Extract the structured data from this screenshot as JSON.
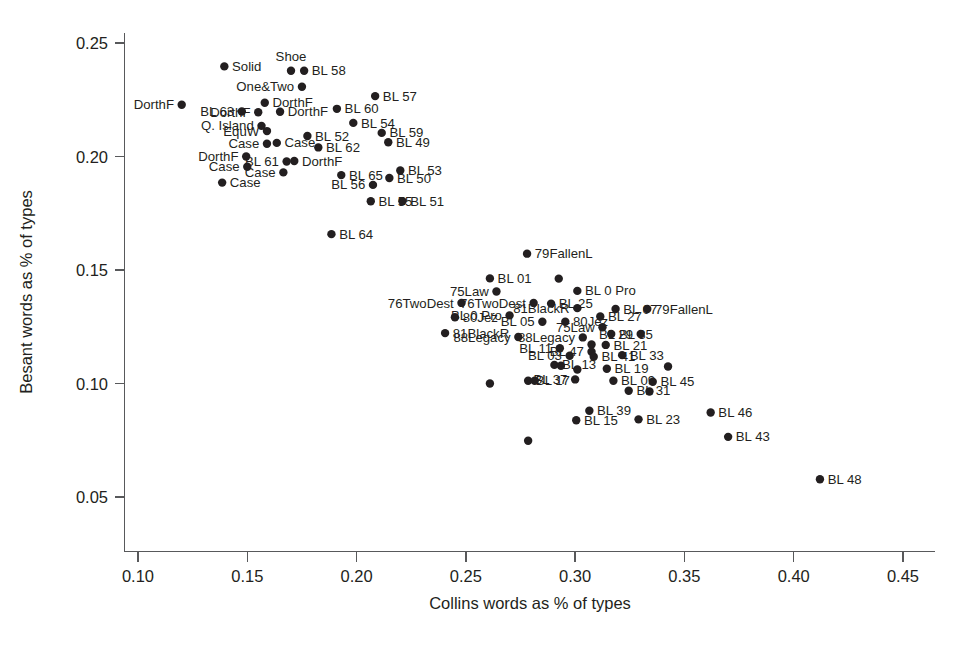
{
  "chart_data": {
    "type": "scatter",
    "title": "",
    "xlabel": "Collins words as % of types",
    "ylabel": "Besant words as % of types",
    "xlim": [
      0.0845,
      0.4655
    ],
    "ylim": [
      0.0445,
      0.2585
    ],
    "xticks": [
      0.1,
      0.15,
      0.2,
      0.25,
      0.3,
      0.35,
      0.4,
      0.45
    ],
    "xticklabels": [
      "0.10",
      "0.15",
      "0.20",
      "0.25",
      "0.30",
      "0.35",
      "0.40",
      "0.45"
    ],
    "yticks": [
      0.05,
      0.1,
      0.15,
      0.2,
      0.25
    ],
    "yticklabels": [
      "0.05",
      "0.10",
      "0.15",
      "0.20",
      "0.25"
    ],
    "grid": false,
    "legend": "none",
    "marker_color": "#231f20",
    "marker_size": 4.2,
    "points": [
      {
        "label": "Solid",
        "x": 0.1395,
        "y": 0.2397,
        "pos": "right"
      },
      {
        "label": "Shoe",
        "x": 0.17,
        "y": 0.2378,
        "pos": "above"
      },
      {
        "label": "BL 58",
        "x": 0.176,
        "y": 0.2378,
        "pos": "right"
      },
      {
        "label": "One&Two",
        "x": 0.175,
        "y": 0.2307,
        "pos": "left"
      },
      {
        "label": "BL 57",
        "x": 0.2085,
        "y": 0.2266,
        "pos": "right"
      },
      {
        "label": "DorthF",
        "x": 0.12,
        "y": 0.2228,
        "pos": "left"
      },
      {
        "label": "DorthF",
        "x": 0.158,
        "y": 0.2237,
        "pos": "right"
      },
      {
        "label": "BL 63",
        "x": 0.1475,
        "y": 0.2198,
        "pos": "left"
      },
      {
        "label": "DorthF",
        "x": 0.155,
        "y": 0.2195,
        "pos": "left"
      },
      {
        "label": "DorthF",
        "x": 0.165,
        "y": 0.2197,
        "pos": "right"
      },
      {
        "label": "BL 60",
        "x": 0.191,
        "y": 0.221,
        "pos": "right"
      },
      {
        "label": "BL 54",
        "x": 0.1985,
        "y": 0.2148,
        "pos": "right"
      },
      {
        "label": "Q. Island",
        "x": 0.1565,
        "y": 0.2135,
        "pos": "left"
      },
      {
        "label": "EquW",
        "x": 0.159,
        "y": 0.2112,
        "pos": "left"
      },
      {
        "label": "BL 59",
        "x": 0.2115,
        "y": 0.2104,
        "pos": "right"
      },
      {
        "label": "BL 52",
        "x": 0.1775,
        "y": 0.209,
        "pos": "right"
      },
      {
        "label": "BL 49",
        "x": 0.2145,
        "y": 0.2063,
        "pos": "right"
      },
      {
        "label": "Case",
        "x": 0.159,
        "y": 0.2056,
        "pos": "left"
      },
      {
        "label": "Case",
        "x": 0.1635,
        "y": 0.206,
        "pos": "right"
      },
      {
        "label": "BL 62",
        "x": 0.1825,
        "y": 0.204,
        "pos": "right"
      },
      {
        "label": "DorthF",
        "x": 0.1495,
        "y": 0.2,
        "pos": "left"
      },
      {
        "label": "BL 61",
        "x": 0.168,
        "y": 0.1978,
        "pos": "left"
      },
      {
        "label": "DorthF",
        "x": 0.1715,
        "y": 0.198,
        "pos": "right"
      },
      {
        "label": "Case",
        "x": 0.15,
        "y": 0.1955,
        "pos": "left"
      },
      {
        "label": "BL 53",
        "x": 0.22,
        "y": 0.1938,
        "pos": "right"
      },
      {
        "label": "Case",
        "x": 0.1665,
        "y": 0.193,
        "pos": "left"
      },
      {
        "label": "BL 65",
        "x": 0.193,
        "y": 0.1918,
        "pos": "right"
      },
      {
        "label": "BL 50",
        "x": 0.215,
        "y": 0.1905,
        "pos": "right"
      },
      {
        "label": "BL 56",
        "x": 0.2075,
        "y": 0.1875,
        "pos": "left"
      },
      {
        "label": "Case",
        "x": 0.1385,
        "y": 0.1885,
        "pos": "right"
      },
      {
        "label": "BL 55",
        "x": 0.2065,
        "y": 0.1803,
        "pos": "right"
      },
      {
        "label": "BL 51",
        "x": 0.221,
        "y": 0.1803,
        "pos": "right"
      },
      {
        "label": "BL 64",
        "x": 0.1885,
        "y": 0.1658,
        "pos": "right"
      },
      {
        "label": "79FallenL",
        "x": 0.278,
        "y": 0.1572,
        "pos": "right"
      },
      {
        "label": "BL 01",
        "x": 0.261,
        "y": 0.1463,
        "pos": "right"
      },
      {
        "label": "",
        "x": 0.2925,
        "y": 0.1462,
        "pos": "none"
      },
      {
        "label": "75Law",
        "x": 0.264,
        "y": 0.1405,
        "pos": "left"
      },
      {
        "label": "BL 0 Pro",
        "x": 0.301,
        "y": 0.1408,
        "pos": "right"
      },
      {
        "label": "76TwoDest",
        "x": 0.248,
        "y": 0.1355,
        "pos": "left"
      },
      {
        "label": "76TwoDest",
        "x": 0.281,
        "y": 0.1355,
        "pos": "left"
      },
      {
        "label": "BL 25",
        "x": 0.289,
        "y": 0.1352,
        "pos": "right"
      },
      {
        "label": "81BlackR",
        "x": 0.301,
        "y": 0.1332,
        "pos": "left"
      },
      {
        "label": "BL 07",
        "x": 0.3185,
        "y": 0.1328,
        "pos": "right"
      },
      {
        "label": "79FallenL",
        "x": 0.333,
        "y": 0.1328,
        "pos": "right"
      },
      {
        "label": "80Jez",
        "x": 0.245,
        "y": 0.1292,
        "pos": "right"
      },
      {
        "label": "BL 0 Pro",
        "x": 0.27,
        "y": 0.13,
        "pos": "left"
      },
      {
        "label": "BL 27",
        "x": 0.3115,
        "y": 0.1295,
        "pos": "right"
      },
      {
        "label": "BL 05",
        "x": 0.285,
        "y": 0.1272,
        "pos": "left"
      },
      {
        "label": "80Jez",
        "x": 0.2955,
        "y": 0.1272,
        "pos": "right"
      },
      {
        "label": "75Law",
        "x": 0.3125,
        "y": 0.1248,
        "pos": "left"
      },
      {
        "label": "BL 35",
        "x": 0.3165,
        "y": 0.1218,
        "pos": "right"
      },
      {
        "label": "BL 29",
        "x": 0.33,
        "y": 0.1218,
        "pos": "left"
      },
      {
        "label": "81BlackR",
        "x": 0.2405,
        "y": 0.1222,
        "pos": "right"
      },
      {
        "label": "88Legacy",
        "x": 0.274,
        "y": 0.1205,
        "pos": "left"
      },
      {
        "label": "88Legacy",
        "x": 0.3035,
        "y": 0.1203,
        "pos": "left"
      },
      {
        "label": "BL 21",
        "x": 0.314,
        "y": 0.117,
        "pos": "right"
      },
      {
        "label": "",
        "x": 0.3075,
        "y": 0.1172,
        "pos": "none"
      },
      {
        "label": "BL 11",
        "x": 0.293,
        "y": 0.1155,
        "pos": "left"
      },
      {
        "label": "BL 47",
        "x": 0.3075,
        "y": 0.114,
        "pos": "left"
      },
      {
        "label": "BL 03",
        "x": 0.2975,
        "y": 0.1122,
        "pos": "left"
      },
      {
        "label": "BL 41",
        "x": 0.3085,
        "y": 0.1118,
        "pos": "right"
      },
      {
        "label": "BL 33",
        "x": 0.3215,
        "y": 0.1125,
        "pos": "right"
      },
      {
        "label": "BL 13",
        "x": 0.2905,
        "y": 0.1082,
        "pos": "right"
      },
      {
        "label": "",
        "x": 0.2935,
        "y": 0.1078,
        "pos": "none"
      },
      {
        "label": "BL 19",
        "x": 0.3145,
        "y": 0.1065,
        "pos": "right"
      },
      {
        "label": "",
        "x": 0.301,
        "y": 0.1062,
        "pos": "none"
      },
      {
        "label": "",
        "x": 0.3425,
        "y": 0.1075,
        "pos": "none"
      },
      {
        "label": "BL 17",
        "x": 0.2785,
        "y": 0.1012,
        "pos": "right"
      },
      {
        "label": "",
        "x": 0.2815,
        "y": 0.1012,
        "pos": "none"
      },
      {
        "label": "BL 37",
        "x": 0.3,
        "y": 0.1018,
        "pos": "left"
      },
      {
        "label": "BL 09",
        "x": 0.3175,
        "y": 0.1012,
        "pos": "right"
      },
      {
        "label": "BL 45",
        "x": 0.3355,
        "y": 0.1008,
        "pos": "right"
      },
      {
        "label": "",
        "x": 0.261,
        "y": 0.1,
        "pos": "none"
      },
      {
        "label": "BL 31",
        "x": 0.3245,
        "y": 0.0968,
        "pos": "right"
      },
      {
        "label": "",
        "x": 0.334,
        "y": 0.0965,
        "pos": "none"
      },
      {
        "label": "BL 39",
        "x": 0.3065,
        "y": 0.088,
        "pos": "right"
      },
      {
        "label": "BL 46",
        "x": 0.362,
        "y": 0.0872,
        "pos": "right"
      },
      {
        "label": "BL 15",
        "x": 0.3005,
        "y": 0.0838,
        "pos": "right"
      },
      {
        "label": "BL 23",
        "x": 0.329,
        "y": 0.0842,
        "pos": "right"
      },
      {
        "label": "BL 43",
        "x": 0.37,
        "y": 0.0765,
        "pos": "right"
      },
      {
        "label": "",
        "x": 0.2785,
        "y": 0.0748,
        "pos": "none"
      },
      {
        "label": "BL 48",
        "x": 0.412,
        "y": 0.0578,
        "pos": "right"
      }
    ]
  },
  "axes": {
    "x_title": "Collins words as % of types",
    "y_title": "Besant words as % of types"
  }
}
